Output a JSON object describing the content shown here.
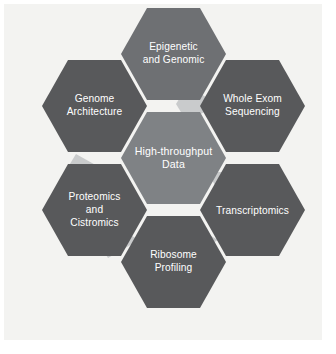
{
  "figure": {
    "background_color": "#ffffff",
    "panel_color": "#f3f3f1"
  },
  "colors": {
    "center_fill": "#7f8285",
    "outer_fill_dark": "#58595b",
    "outer_fill_medium": "#6e7073",
    "connector_fill": "#c9cbcc",
    "label_text": "#ffffff"
  },
  "diagram": {
    "type": "hexagon-cluster",
    "layout": "honeycomb-center-plus-six",
    "center": {
      "id": "high-throughput-data",
      "lines": [
        "High-throughput",
        "Data"
      ],
      "fill": "#7f8285"
    },
    "nodes": [
      {
        "id": "epigenetic-and-genomic",
        "position": "top",
        "lines": [
          "Epigenetic",
          "and Genomic"
        ],
        "fill": "#6e7073"
      },
      {
        "id": "whole-exom-sequencing",
        "position": "top-right",
        "lines": [
          "Whole Exom",
          "Sequencing"
        ],
        "fill": "#58595b"
      },
      {
        "id": "transcriptomics",
        "position": "bottom-right",
        "lines": [
          "Transcriptomics"
        ],
        "fill": "#58595b"
      },
      {
        "id": "ribosome-profiling",
        "position": "bottom",
        "lines": [
          "Ribosome",
          "Profiling"
        ],
        "fill": "#58595b"
      },
      {
        "id": "proteomics-and-cistromics",
        "position": "bottom-left",
        "lines": [
          "Proteomics",
          "and",
          "Cistromics"
        ],
        "fill": "#58595b"
      },
      {
        "id": "genome-architecture",
        "position": "top-left",
        "lines": [
          "Genome",
          "Architecture"
        ],
        "fill": "#58595b"
      }
    ]
  }
}
